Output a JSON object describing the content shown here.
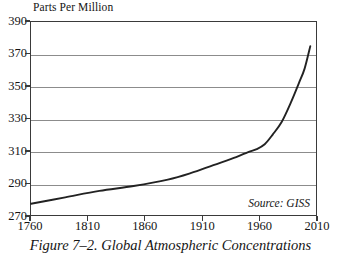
{
  "figure": {
    "caption_number": "Figure 7–2.",
    "caption_title": "Global Atmospheric Concentrations",
    "caption_full": "Figure 7–2. Global Atmospheric Concentrations"
  },
  "chart_data": {
    "type": "line",
    "title": "Parts Per Million",
    "xlabel": "",
    "ylabel": "Parts Per Million",
    "source": "Source: GISS",
    "xlim": [
      1760,
      2010
    ],
    "ylim": [
      270,
      390
    ],
    "xticks": [
      1760,
      1810,
      1860,
      1910,
      1960,
      2010
    ],
    "yticks": [
      270,
      290,
      310,
      330,
      350,
      370,
      390
    ],
    "xtick_labels": [
      "1760",
      "1810",
      "1860",
      "1910",
      "1960",
      "2010"
    ],
    "ytick_labels": [
      "270",
      "290",
      "310",
      "330",
      "350",
      "370",
      "390"
    ],
    "grid": "horizontal",
    "gridline_values": [
      290,
      310,
      330,
      350,
      370
    ],
    "legend": "none",
    "series": [
      {
        "name": "Atmospheric CO2 concentration",
        "color": "#222222",
        "x": [
          1760,
          1790,
          1820,
          1850,
          1880,
          1900,
          1920,
          1940,
          1950,
          1958,
          1965,
          1972,
          1980,
          1988,
          1995,
          2000,
          2005
        ],
        "values": [
          277,
          281,
          285,
          288,
          292,
          296,
          301,
          306,
          309,
          311,
          314,
          320,
          328,
          340,
          352,
          361,
          375
        ]
      }
    ]
  }
}
